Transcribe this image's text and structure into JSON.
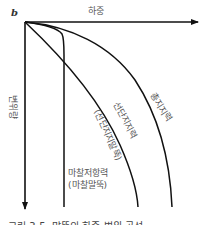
{
  "diagram": {
    "type": "load-settlement curves",
    "origin_label": "b",
    "x_axis_label": "하중",
    "y_axis_label": "변위량",
    "curves": [
      {
        "id": "friction",
        "label_line1": "마찰저항력",
        "label_line2": "(마찰말뚝)"
      },
      {
        "id": "end-bearing",
        "label_line1": "선단지지력",
        "label_line2": "(선단지지말뚝)"
      },
      {
        "id": "total",
        "label_line1": "총지지력"
      }
    ],
    "caption": "그림 3-5. 말뚝의 하중-변위 곡선"
  }
}
